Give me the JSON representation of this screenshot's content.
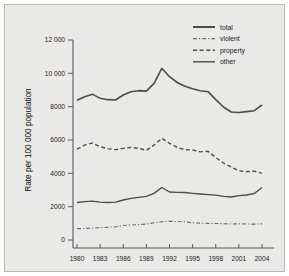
{
  "figure": {
    "background_color": "#e9e9e7",
    "border_color": "#b9b9b5",
    "line_color": "#4d4d4d"
  },
  "chart_data": {
    "type": "line",
    "title": "",
    "xlabel": "",
    "ylabel": "Rate per 100 000 population",
    "x": [
      1980,
      1981,
      1982,
      1983,
      1984,
      1985,
      1986,
      1987,
      1988,
      1989,
      1990,
      1991,
      1992,
      1993,
      1994,
      1995,
      1996,
      1997,
      1998,
      1999,
      2000,
      2001,
      2002,
      2003,
      2004
    ],
    "xlim": [
      1979,
      2005
    ],
    "ylim": [
      0,
      12000
    ],
    "xticks": [
      1980,
      1983,
      1986,
      1989,
      1992,
      1995,
      1998,
      2001,
      2004
    ],
    "xticklabels": [
      "1980",
      "1983",
      "1986",
      "1989",
      "1992",
      "1995",
      "1998",
      "2001",
      "2004"
    ],
    "yticks": [
      0,
      2000,
      4000,
      6000,
      8000,
      10000,
      12000
    ],
    "yticklabels": [
      "0",
      "2000",
      "4000",
      "6000",
      "8000",
      "10 000",
      "12 000"
    ],
    "grid": false,
    "legend_position": "top-right",
    "series": [
      {
        "name": "total",
        "style": "solid",
        "linewidth": 1.6,
        "color": "#4d4d4d",
        "values": [
          8380,
          8600,
          8750,
          8500,
          8420,
          8400,
          8700,
          8900,
          8960,
          8930,
          9400,
          10300,
          9800,
          9450,
          9220,
          9080,
          8960,
          8900,
          8420,
          7980,
          7680,
          7650,
          7700,
          7760,
          8100
        ]
      },
      {
        "name": "violent",
        "style": "dashdot",
        "linewidth": 1.1,
        "color": "#6b6b6b",
        "values": [
          680,
          690,
          720,
          740,
          760,
          790,
          870,
          900,
          920,
          960,
          1030,
          1100,
          1120,
          1110,
          1090,
          1030,
          1010,
          1000,
          990,
          980,
          960,
          970,
          960,
          950,
          970
        ]
      },
      {
        "name": "property",
        "style": "dashed",
        "linewidth": 1.4,
        "color": "#4d4d4d",
        "values": [
          5450,
          5700,
          5820,
          5600,
          5480,
          5420,
          5500,
          5550,
          5500,
          5380,
          5700,
          6100,
          5800,
          5560,
          5420,
          5400,
          5290,
          5320,
          4950,
          4620,
          4380,
          4150,
          4100,
          4130,
          4000
        ]
      },
      {
        "name": "other",
        "style": "solid",
        "linewidth": 1.4,
        "color": "#4d4d4d",
        "values": [
          2250,
          2300,
          2330,
          2270,
          2250,
          2270,
          2400,
          2500,
          2560,
          2620,
          2800,
          3150,
          2880,
          2860,
          2850,
          2800,
          2760,
          2720,
          2690,
          2620,
          2580,
          2660,
          2700,
          2790,
          3150
        ]
      }
    ]
  },
  "legend": {
    "items": [
      {
        "label": "total",
        "style": "solid-thick"
      },
      {
        "label": "violent",
        "style": "dashdot"
      },
      {
        "label": "property",
        "style": "dashed"
      },
      {
        "label": "other",
        "style": "solid"
      }
    ]
  }
}
